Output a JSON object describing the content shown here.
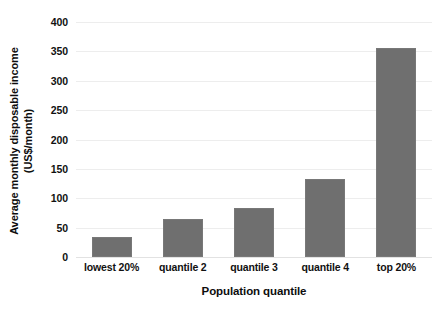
{
  "chart_data": {
    "type": "bar",
    "title": "",
    "subtitle": "",
    "categories": [
      "lowest 20%",
      "quantile 2",
      "quantile 3",
      "quantile 4",
      "top 20%"
    ],
    "values": [
      34,
      64,
      83,
      132,
      356
    ],
    "xlabel": "Population quantile",
    "ylabel": "Average monthly disposable income (US$/month)",
    "ylabel_lines": [
      "Average monthly disposable income",
      "(US$/month)"
    ],
    "ylim": [
      0,
      400
    ],
    "ytick_labels": [
      "0",
      "50",
      "100",
      "150",
      "200",
      "250",
      "300",
      "350",
      "400"
    ],
    "ytick_values": [
      0,
      50,
      100,
      150,
      200,
      250,
      300,
      350,
      400
    ],
    "grid": "horizontal",
    "legend": "none",
    "bar_color": "#6f6f6f",
    "gridline_color": "#ededed",
    "background_color": "#ffffff",
    "text_color": "#111111"
  }
}
